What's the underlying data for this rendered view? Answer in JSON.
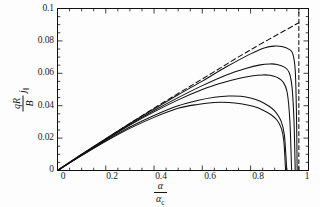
{
  "figure": {
    "background_color": "#fdfdfd",
    "ink_color": "#111111"
  },
  "axes": {
    "x_tick_labels": [
      "0",
      "0.2",
      "0.4",
      "0.6",
      "0.8",
      "1"
    ],
    "y_tick_labels": [
      "0",
      "0.02",
      "0.04",
      "0.06",
      "0.08",
      "0.1"
    ],
    "x_title_numerator": "α",
    "x_title_denominator": "α",
    "x_title_denominator_sub": "c",
    "y_title_numerator": "qR",
    "y_title_denominator": "B",
    "y_title_factor": "j",
    "y_title_factor_sub": "‖"
  },
  "chart_data": {
    "type": "line",
    "title": "",
    "xlabel": "α/α_c",
    "ylabel": "(qR/B) j_‖",
    "xlim": [
      0,
      1.04
    ],
    "ylim": [
      0,
      0.1
    ],
    "x_ticks": [
      0,
      0.2,
      0.4,
      0.6,
      0.8,
      1
    ],
    "y_ticks": [
      0,
      0.02,
      0.04,
      0.06,
      0.08,
      0.1
    ],
    "grid": false,
    "legend": "none",
    "series": [
      {
        "name": "asymptote",
        "style": "dashed",
        "x": [
          0,
          0.2,
          0.4,
          0.6,
          0.8,
          1.0
        ],
        "values": [
          0,
          0.0195,
          0.0385,
          0.0565,
          0.0745,
          0.0912
        ]
      },
      {
        "name": "vertical-cutoff",
        "style": "dashed-vertical",
        "x": [
          1.0,
          1.0
        ],
        "values": [
          0,
          0.1
        ]
      },
      {
        "name": "curve-1",
        "style": "solid",
        "x": [
          0,
          0.1,
          0.2,
          0.3,
          0.4,
          0.5,
          0.6,
          0.7,
          0.8,
          0.86,
          0.9,
          0.93,
          0.96,
          0.975,
          0.985,
          0.99,
          0.993
        ],
        "values": [
          0,
          0.01,
          0.0196,
          0.029,
          0.038,
          0.0468,
          0.0552,
          0.064,
          0.072,
          0.0758,
          0.0768,
          0.0765,
          0.0748,
          0.072,
          0.062,
          0.036,
          0.0
        ]
      },
      {
        "name": "curve-2",
        "style": "solid",
        "x": [
          0,
          0.1,
          0.2,
          0.3,
          0.4,
          0.5,
          0.6,
          0.7,
          0.78,
          0.84,
          0.88,
          0.91,
          0.94,
          0.96,
          0.972,
          0.98,
          0.985
        ],
        "values": [
          0,
          0.0098,
          0.0192,
          0.0284,
          0.037,
          0.045,
          0.0524,
          0.059,
          0.063,
          0.0652,
          0.0658,
          0.0655,
          0.0638,
          0.0605,
          0.051,
          0.03,
          0.0
        ]
      },
      {
        "name": "curve-3",
        "style": "solid",
        "x": [
          0,
          0.1,
          0.2,
          0.3,
          0.4,
          0.5,
          0.6,
          0.68,
          0.75,
          0.81,
          0.85,
          0.88,
          0.91,
          0.935,
          0.952,
          0.963,
          0.97
        ],
        "values": [
          0,
          0.0097,
          0.019,
          0.028,
          0.0362,
          0.0436,
          0.05,
          0.054,
          0.0568,
          0.0585,
          0.059,
          0.0588,
          0.0575,
          0.0546,
          0.048,
          0.03,
          0.0
        ]
      },
      {
        "name": "curve-4",
        "style": "solid",
        "x": [
          0,
          0.1,
          0.2,
          0.3,
          0.4,
          0.5,
          0.58,
          0.65,
          0.71,
          0.76,
          0.8,
          0.84,
          0.875,
          0.9,
          0.925,
          0.94,
          0.95
        ],
        "values": [
          0,
          0.0094,
          0.0184,
          0.0268,
          0.034,
          0.04,
          0.0432,
          0.0452,
          0.046,
          0.0458,
          0.0448,
          0.0428,
          0.0398,
          0.0368,
          0.031,
          0.022,
          0.0
        ]
      },
      {
        "name": "curve-5",
        "style": "solid",
        "x": [
          0,
          0.1,
          0.2,
          0.3,
          0.4,
          0.5,
          0.58,
          0.65,
          0.71,
          0.76,
          0.81,
          0.85,
          0.885,
          0.91,
          0.928,
          0.938,
          0.945
        ],
        "values": [
          0,
          0.0092,
          0.018,
          0.026,
          0.0328,
          0.0384,
          0.0408,
          0.042,
          0.042,
          0.0412,
          0.0396,
          0.0374,
          0.0344,
          0.031,
          0.0258,
          0.018,
          0.0
        ]
      }
    ]
  }
}
